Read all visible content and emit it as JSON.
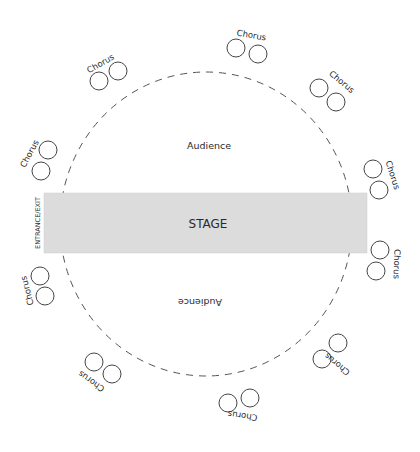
{
  "diagram": {
    "type": "theatre-in-the-round seating plan",
    "colors": {
      "stage_fill": "#dcdcdc",
      "stroke": "#444444",
      "dashed_ring": "#555555",
      "text": "#2a2a2a"
    },
    "stage": {
      "label": "STAGE",
      "side_label": "ENTRANCE/EXIT"
    },
    "audience": [
      {
        "label": "Audience",
        "orientation": "upright"
      },
      {
        "label": "Audience",
        "orientation": "upside-down"
      }
    ],
    "chorus_groups": [
      {
        "label": "Chorus",
        "position": "top-left"
      },
      {
        "label": "Chorus",
        "position": "top"
      },
      {
        "label": "Chorus",
        "position": "top-right"
      },
      {
        "label": "Chorus",
        "position": "right-upper"
      },
      {
        "label": "Chorus",
        "position": "right-lower"
      },
      {
        "label": "Chorus",
        "position": "bottom-right"
      },
      {
        "label": "Chorus",
        "position": "bottom"
      },
      {
        "label": "Chorus",
        "position": "bottom-left"
      },
      {
        "label": "Chorus",
        "position": "left-lower"
      },
      {
        "label": "Chorus",
        "position": "left-upper"
      }
    ],
    "performers_per_group": 2
  }
}
